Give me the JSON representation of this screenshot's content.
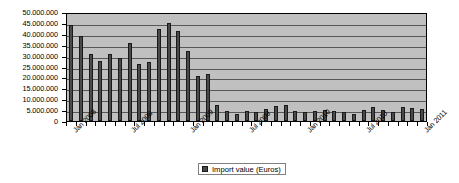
{
  "chart_data": {
    "type": "bar",
    "title": "",
    "xlabel": "",
    "ylabel": "",
    "ylim": [
      0,
      50000000
    ],
    "ytick_step": 5000000,
    "grid": true,
    "legend_position": "bottom",
    "bar_color": "#4a4a4a",
    "plot_background": "#c0c0c0",
    "series": [
      {
        "name": "Import value (Euros)",
        "values": [
          45000000,
          39500000,
          31500000,
          28000000,
          31500000,
          29500000,
          36500000,
          26500000,
          27500000,
          43000000,
          46000000,
          42000000,
          32500000,
          21000000,
          22000000,
          7500000,
          4500000,
          3500000,
          4500000,
          4000000,
          5500000,
          7000000,
          7500000,
          4500000,
          4000000,
          4500000,
          5000000,
          4500000,
          4000000,
          3500000,
          5000000,
          6500000,
          5000000,
          4000000,
          6500000,
          6000000,
          5500000
        ]
      }
    ],
    "categories": [
      "Jan 2008",
      "Feb 2008",
      "Mar 2008",
      "Apr 2008",
      "May 2008",
      "Jun 2008",
      "Jul 2008",
      "Aug 2008",
      "Sep 2008",
      "Oct 2008",
      "Nov 2008",
      "Dec 2008",
      "Jan 2009",
      "Feb 2009",
      "Mar 2009",
      "Apr 2009",
      "May 2009",
      "Jun 2009",
      "Jul 2009",
      "Aug 2009",
      "Sep 2009",
      "Oct 2009",
      "Nov 2009",
      "Dec 2009",
      "Jan 2010",
      "Feb 2010",
      "Mar 2010",
      "Apr 2010",
      "May 2010",
      "Jun 2010",
      "Jul 2010",
      "Aug 2010",
      "Sep 2010",
      "Oct 2010",
      "Nov 2010",
      "Dec 2010",
      "Jan 2011"
    ],
    "ytick_labels": [
      "50.000.000",
      "45.000.000",
      "40.000.000",
      "35.000.000",
      "30.000.000",
      "25.000.000",
      "20.000.000",
      "15.000.000",
      "10.000.000",
      "5.000.000",
      "0"
    ],
    "xtick_labels": [
      {
        "label": "Jan 2008",
        "index": 0
      },
      {
        "label": "Jul 2008",
        "index": 6
      },
      {
        "label": "Jan 2009",
        "index": 12
      },
      {
        "label": "Jul 2009",
        "index": 18
      },
      {
        "label": "Jan 2010",
        "index": 24
      },
      {
        "label": "Jul 2010",
        "index": 30
      },
      {
        "label": "Jan 2011",
        "index": 36
      }
    ]
  },
  "legend": {
    "entries": [
      {
        "label": "Import value (Euros)",
        "color": "#4a4a4a"
      }
    ]
  }
}
